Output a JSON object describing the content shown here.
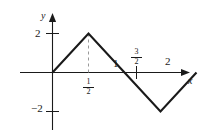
{
  "figure": {
    "name": "triangular-wave-graph",
    "background_color": "#ffffff",
    "line_color": "#1a1a1a",
    "axis_color": "#1a1a1a",
    "dash_color": "#999999"
  },
  "axes": {
    "x_label": "x",
    "y_label": "y",
    "x_ticks": [
      {
        "label": "1/2",
        "display": "fraction",
        "numerator": "1",
        "denominator": "2",
        "value": 0.5,
        "position": "below-axis"
      },
      {
        "label": "1",
        "display": "integer",
        "value": 1,
        "position": "above-axis"
      },
      {
        "label": "3/2",
        "display": "fraction",
        "numerator": "3",
        "denominator": "2",
        "value": 1.5,
        "position": "above-axis"
      },
      {
        "label": "2",
        "display": "integer",
        "value": 2,
        "position": "above-axis"
      }
    ],
    "y_ticks": [
      {
        "label": "2",
        "value": 2
      },
      {
        "label": "-2",
        "value": -2
      }
    ],
    "x_range": [
      -0.35,
      2.35
    ],
    "y_range": [
      -2.9,
      2.9
    ]
  },
  "labels": {
    "y_axis": "y",
    "x_axis": "x",
    "y_tick_2": "2",
    "y_tick_neg2": "−2",
    "x_tick_1": "1",
    "x_tick_2": "2",
    "frac_half_num": "1",
    "frac_half_den": "2",
    "frac_three_halves_num": "3",
    "frac_three_halves_den": "2"
  },
  "chart_data": {
    "type": "line",
    "title": "",
    "xlabel": "x",
    "ylabel": "y",
    "xlim": [
      -0.35,
      2.35
    ],
    "ylim": [
      -2.9,
      2.9
    ],
    "grid": false,
    "legend": null,
    "series": [
      {
        "name": "triangular wave",
        "x": [
          0,
          0.5,
          1,
          1.5,
          2
        ],
        "y": [
          0,
          2,
          0,
          -2,
          0
        ]
      }
    ],
    "annotations": [
      {
        "type": "dashed-vertical",
        "x": 0.5,
        "y_from": 0,
        "y_to": 2,
        "color": "#999999"
      }
    ],
    "xticks": [
      0.5,
      1,
      1.5,
      2
    ],
    "xticklabels": [
      "1/2",
      "1",
      "3/2",
      "2"
    ],
    "yticks": [
      -2,
      2
    ],
    "yticklabels": [
      "-2",
      "2"
    ]
  }
}
